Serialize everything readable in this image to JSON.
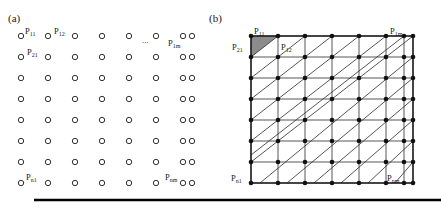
{
  "figure": {
    "panels": [
      {
        "id": "a",
        "label": "(a)",
        "description": "grid-of-points",
        "grid": {
          "rows": 8,
          "cols": 8
        },
        "point_labels": [
          {
            "name": "P11",
            "base": "P",
            "sub": "11"
          },
          {
            "name": "P12",
            "base": "P",
            "sub": "12"
          },
          {
            "name": "P1m",
            "base": "P",
            "sub": "1m"
          },
          {
            "name": "P21",
            "base": "P",
            "sub": "21"
          },
          {
            "name": "Pn1",
            "base": "P",
            "sub": "n1"
          },
          {
            "name": "Pnm",
            "base": "P",
            "sub": "nm"
          }
        ],
        "ellipsis": "..."
      },
      {
        "id": "b",
        "label": "(b)",
        "description": "triangulated-mesh",
        "grid": {
          "rows": 8,
          "cols": 8
        },
        "point_labels": [
          {
            "name": "P11",
            "base": "P",
            "sub": "11"
          },
          {
            "name": "P12",
            "base": "P",
            "sub": "12"
          },
          {
            "name": "P1m",
            "base": "P",
            "sub": "1m"
          },
          {
            "name": "P21",
            "base": "P",
            "sub": "21"
          },
          {
            "name": "Pn1",
            "base": "P",
            "sub": "n1"
          },
          {
            "name": "Pnm",
            "base": "P",
            "sub": "nm"
          }
        ],
        "shaded_cell": "top-left-upper-triangle"
      }
    ],
    "colors": {
      "point_stroke": "#1a1a1a",
      "point_fill": "#ffffff",
      "node_fill": "#111111",
      "mesh_line": "#2b2b2b",
      "border": "#1a1a1a",
      "shade": "#8c8c8c",
      "baseline": "#000000",
      "background": "#ffffff"
    }
  }
}
